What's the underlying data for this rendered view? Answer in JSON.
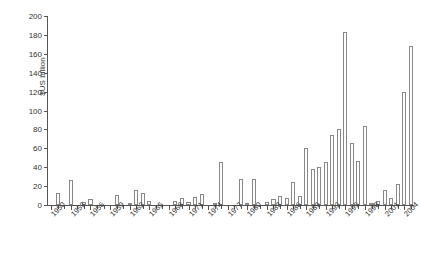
{
  "chart_data": {
    "type": "bar",
    "title": "",
    "subtitle": "",
    "xlabel": "",
    "ylabel": "$US billion",
    "ylim": [
      0,
      200
    ],
    "ytick_step": 20,
    "yticks": [
      0,
      20,
      40,
      60,
      80,
      100,
      120,
      140,
      160,
      180,
      200
    ],
    "ytick_labels": [
      "0",
      "20",
      "40",
      "60",
      "80",
      "100",
      "120",
      "140",
      "160",
      "180",
      "200"
    ],
    "grid": false,
    "legend": null,
    "xtick_labels": [
      "1950",
      "1953",
      "1956",
      "1959",
      "1962",
      "1965",
      "1968",
      "1971",
      "1974",
      "1977",
      "1980",
      "1983",
      "1986",
      "1989",
      "1992",
      "1995",
      "1998",
      "2001",
      "2004"
    ],
    "xtick_step_years": 3,
    "bar_edge_color": "#888888",
    "bar_fill_color": "#fdfdfd",
    "axis_color": "#555555",
    "text_color": "#333333",
    "categories": [
      "1950",
      "1951",
      "1952",
      "1953",
      "1954",
      "1955",
      "1956",
      "1957",
      "1958",
      "1959",
      "1960",
      "1961",
      "1962",
      "1963",
      "1964",
      "1965",
      "1966",
      "1967",
      "1968",
      "1969",
      "1970",
      "1971",
      "1972",
      "1973",
      "1974",
      "1975",
      "1976",
      "1977",
      "1978",
      "1979",
      "1980",
      "1981",
      "1982",
      "1983",
      "1984",
      "1985",
      "1986",
      "1987",
      "1988",
      "1989",
      "1990",
      "1991",
      "1992",
      "1993",
      "1994",
      "1995",
      "1996",
      "1997",
      "1998",
      "1999",
      "2000",
      "2001",
      "2002",
      "2003",
      "2004",
      "2005"
    ],
    "values": [
      0,
      13,
      0,
      26,
      0,
      3,
      6,
      0,
      0,
      0,
      11,
      0,
      2,
      16,
      13,
      4,
      0,
      0,
      0,
      4,
      7,
      3,
      8,
      12,
      0,
      2,
      46,
      0,
      0,
      28,
      1,
      28,
      0,
      3,
      6,
      10,
      7,
      24,
      10,
      60,
      38,
      40,
      46,
      74,
      80,
      183,
      66,
      47,
      84,
      2,
      4,
      16,
      7,
      22,
      120,
      168
    ]
  }
}
